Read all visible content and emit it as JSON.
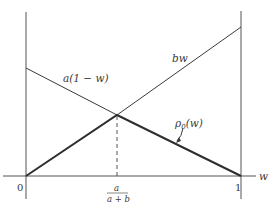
{
  "diagram": {
    "type": "piecewise-linear-plot",
    "axis": {
      "x_label": "w",
      "origin_label": "0",
      "right_tick_label": "1",
      "crossing_label_numerator": "a",
      "crossing_label_denominator": "a + b"
    },
    "curves": [
      {
        "name": "a(1-w)",
        "label": "a(1 − w)",
        "from": [
          0,
          "a"
        ],
        "to": [
          1,
          0
        ]
      },
      {
        "name": "bw",
        "label": "bw",
        "from": [
          0,
          0
        ],
        "to": [
          1,
          "b"
        ]
      },
      {
        "name": "rho0",
        "label": "ρ",
        "label_sub": "0",
        "label_arg": "(w)",
        "description": "lower envelope min(a(1−w), bw), drawn bold"
      }
    ],
    "intersection": {
      "w": "a/(a+b)",
      "style": "dashed drop line"
    },
    "colors": {
      "line": "#3a3a3a",
      "axis": "#555555",
      "background": "#ffffff"
    }
  }
}
